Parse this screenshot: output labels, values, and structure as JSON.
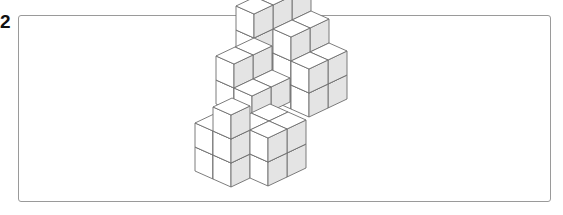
{
  "question": {
    "number": "2"
  },
  "figure": {
    "colors": {
      "top_face": "#ffffff",
      "left_face": "#ffffff",
      "right_face": "#e4e4e4",
      "edge": "#6e6e6e",
      "frame": "#9a9a9a"
    },
    "origin": [
      231,
      187
    ],
    "vec_a": [
      19,
      -9
    ],
    "vec_b": [
      -18,
      -8
    ],
    "vec_up": [
      0,
      -24
    ],
    "cubes": [
      [
        6,
        3,
        0
      ],
      [
        6,
        3,
        1
      ],
      [
        6,
        2,
        0
      ],
      [
        6,
        2,
        1
      ],
      [
        6,
        4,
        2
      ],
      [
        5,
        4,
        2
      ],
      [
        5,
        4,
        3
      ],
      [
        6,
        3,
        2
      ],
      [
        6,
        4,
        1
      ],
      [
        7,
        3,
        0
      ],
      [
        7,
        3,
        1
      ],
      [
        7,
        2,
        0
      ],
      [
        7,
        2,
        1
      ],
      [
        7,
        3,
        2
      ],
      [
        7,
        4,
        3
      ],
      [
        6,
        4,
        3
      ],
      [
        3,
        2,
        0
      ],
      [
        3,
        2,
        1
      ],
      [
        3,
        3,
        1
      ],
      [
        4,
        2,
        1
      ],
      [
        4,
        3,
        1
      ],
      [
        3,
        3,
        2
      ],
      [
        4,
        3,
        2
      ],
      [
        0,
        1,
        0
      ],
      [
        0,
        1,
        1
      ],
      [
        0,
        0,
        0
      ],
      [
        0,
        0,
        1
      ],
      [
        0,
        0,
        2
      ],
      [
        1,
        -1,
        0
      ],
      [
        1,
        -1,
        1
      ],
      [
        2,
        -1,
        0
      ],
      [
        2,
        -1,
        1
      ],
      [
        1,
        0,
        1
      ],
      [
        2,
        0,
        1
      ]
    ]
  }
}
